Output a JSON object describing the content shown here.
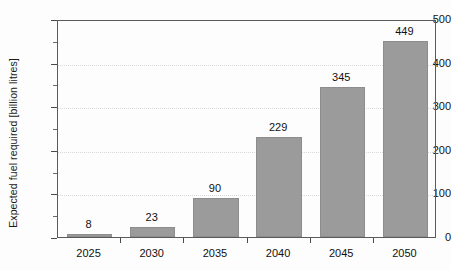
{
  "chart_data": {
    "type": "bar",
    "title": "",
    "subtitle": "",
    "xlabel": "",
    "ylabel": "Expected fuel required [billion litres]",
    "categories": [
      "2025",
      "2030",
      "2035",
      "2040",
      "2045",
      "2050"
    ],
    "values": [
      8,
      23,
      90,
      229,
      345,
      449
    ],
    "value_labels": [
      "8",
      "23",
      "90",
      "229",
      "345",
      "449"
    ],
    "ylim": [
      0,
      500
    ],
    "ytick_labels": [
      "0",
      "100",
      "200",
      "300",
      "400",
      "500"
    ],
    "ytick_values": [
      0,
      100,
      200,
      300,
      400,
      500
    ],
    "yminor_values": [
      50,
      150,
      250,
      350,
      450
    ],
    "grid": "horizontal-major-dotted",
    "legend": "none",
    "series": [
      {
        "name": "Expected fuel required",
        "values": [
          8,
          23,
          90,
          229,
          345,
          449
        ]
      }
    ],
    "colors": {
      "bar_fill": "#9b9b9b",
      "bar_edge": "#8d8d8d",
      "axis": "#5a5a5a",
      "gridline": "#d8d8d8",
      "text": "#111111",
      "background": "#fdfdfd"
    }
  }
}
